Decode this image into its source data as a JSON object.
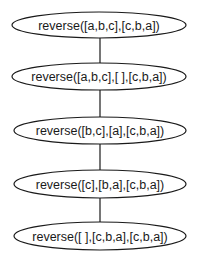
{
  "diagram": {
    "type": "derivation-tree",
    "nodes": [
      {
        "id": "n1",
        "label": "reverse([a,b,c],[c,b,a])"
      },
      {
        "id": "n2",
        "label": "reverse([a,b,c],[ ],[c,b,a])"
      },
      {
        "id": "n3",
        "label": "reverse([b,c],[a],[c,b,a])"
      },
      {
        "id": "n4",
        "label": "reverse([c],[b,a],[c,b,a])"
      },
      {
        "id": "n5",
        "label": "reverse([ ],[c,b,a],[c,b,a])"
      }
    ],
    "edges": [
      {
        "from": "n1",
        "to": "n2"
      },
      {
        "from": "n2",
        "to": "n3"
      },
      {
        "from": "n3",
        "to": "n4"
      },
      {
        "from": "n4",
        "to": "n5"
      }
    ]
  }
}
